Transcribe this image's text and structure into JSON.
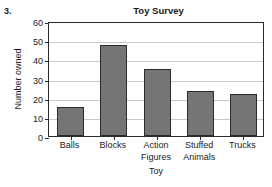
{
  "problem": {
    "number": "3."
  },
  "chart_data": {
    "type": "bar",
    "title": "Toy Survey",
    "xlabel": "Toy",
    "ylabel": "Number owned",
    "categories": [
      "Balls",
      "Blocks",
      "Action Figures",
      "Stuffed Animals",
      "Trucks"
    ],
    "category_lines": [
      [
        "Balls"
      ],
      [
        "Blocks"
      ],
      [
        "Action",
        "Figures"
      ],
      [
        "Stuffed",
        "Animals"
      ],
      [
        "Trucks"
      ]
    ],
    "values": [
      15,
      47.5,
      35,
      23.5,
      22
    ],
    "ylim": [
      0,
      60
    ],
    "ytick_labels": [
      "0",
      "10",
      "20",
      "30",
      "40",
      "50",
      "60"
    ],
    "ytick_values": [
      0,
      10,
      20,
      30,
      40,
      50,
      60
    ],
    "grid": true,
    "legend": false,
    "bar_color": "#757575",
    "bar_edge_color": "#2b2b2b",
    "grid_color": "#c9c9c9",
    "axis_color": "#2b2b2b",
    "background_color": "#ffffff"
  }
}
